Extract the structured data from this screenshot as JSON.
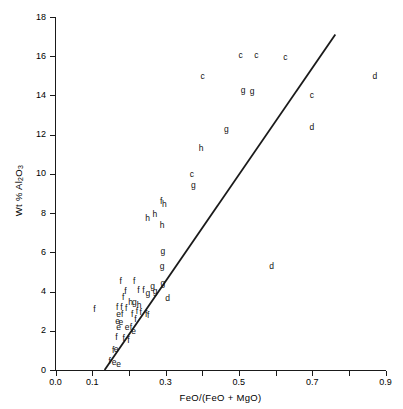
{
  "chart_data": {
    "type": "scatter",
    "title": "",
    "xlabel": "FeO/(FeO + MgO)",
    "ylabel": "Wt % Al2O3",
    "ylabel_html": "Wt % Al<sub>2</sub>O<sub>3</sub>",
    "xlim": [
      0.0,
      0.9
    ],
    "ylim": [
      0,
      18
    ],
    "xticks": [
      0.0,
      0.1,
      0.2,
      0.3,
      0.4,
      0.5,
      0.6,
      0.7,
      0.8,
      0.9
    ],
    "xtick_labels": [
      "0.0",
      "",
      "",
      "0.3",
      "",
      "0.5",
      "",
      "0.7",
      "",
      "0.9"
    ],
    "xtick_labeled": [
      {
        "value": 0.0,
        "label": "0.0"
      },
      {
        "value": 0.1,
        "label": "0.1"
      },
      {
        "value": 0.3,
        "label": "0.3"
      },
      {
        "value": 0.5,
        "label": "0.5"
      },
      {
        "value": 0.7,
        "label": "0.7"
      },
      {
        "value": 0.9,
        "label": "0.9"
      }
    ],
    "yticks": [
      0,
      2,
      4,
      6,
      8,
      10,
      12,
      14,
      16,
      18
    ],
    "ytick_labels": [
      "0",
      "2",
      "4",
      "6",
      "8",
      "10",
      "12",
      "14",
      "16",
      "18"
    ],
    "grid": false,
    "legend": "none",
    "marker_style": "text-letter",
    "series": [
      {
        "name": "c",
        "label_char": "c",
        "color": "#111111"
      },
      {
        "name": "d",
        "label_char": "d",
        "color": "#111111"
      },
      {
        "name": "e",
        "label_char": "e",
        "color": "#111111"
      },
      {
        "name": "f",
        "label_char": "f",
        "color": "#111111"
      },
      {
        "name": "g",
        "label_char": "g",
        "color": "#111111"
      },
      {
        "name": "h",
        "label_char": "h",
        "color": "#111111"
      }
    ],
    "points": [
      {
        "label": "c",
        "x": 0.505,
        "y": 16.05
      },
      {
        "label": "c",
        "x": 0.548,
        "y": 16.05
      },
      {
        "label": "c",
        "x": 0.627,
        "y": 15.95
      },
      {
        "label": "c",
        "x": 0.401,
        "y": 15.0
      },
      {
        "label": "c",
        "x": 0.699,
        "y": 14.05
      },
      {
        "label": "c",
        "x": 0.372,
        "y": 10.0
      },
      {
        "label": "d",
        "x": 0.871,
        "y": 15.0
      },
      {
        "label": "d",
        "x": 0.699,
        "y": 12.4
      },
      {
        "label": "d",
        "x": 0.589,
        "y": 5.3
      },
      {
        "label": "d",
        "x": 0.306,
        "y": 3.65
      },
      {
        "label": "g",
        "x": 0.512,
        "y": 14.3
      },
      {
        "label": "g",
        "x": 0.536,
        "y": 14.25
      },
      {
        "label": "g",
        "x": 0.466,
        "y": 12.3
      },
      {
        "label": "g",
        "x": 0.376,
        "y": 9.45
      },
      {
        "label": "g",
        "x": 0.293,
        "y": 6.05
      },
      {
        "label": "g",
        "x": 0.291,
        "y": 5.3
      },
      {
        "label": "g",
        "x": 0.293,
        "y": 4.45
      },
      {
        "label": "g",
        "x": 0.265,
        "y": 4.3
      },
      {
        "label": "g",
        "x": 0.272,
        "y": 4.05
      },
      {
        "label": "g",
        "x": 0.252,
        "y": 3.95
      },
      {
        "label": "g",
        "x": 0.215,
        "y": 3.45
      },
      {
        "label": "h",
        "x": 0.397,
        "y": 11.3
      },
      {
        "label": "h",
        "x": 0.297,
        "y": 8.45
      },
      {
        "label": "h",
        "x": 0.271,
        "y": 7.95
      },
      {
        "label": "h",
        "x": 0.251,
        "y": 7.75
      },
      {
        "label": "h",
        "x": 0.291,
        "y": 7.4
      },
      {
        "label": "h",
        "x": 0.205,
        "y": 3.45
      },
      {
        "label": "h",
        "x": 0.228,
        "y": 3.3
      },
      {
        "label": "f",
        "x": 0.288,
        "y": 8.6
      },
      {
        "label": "f",
        "x": 0.178,
        "y": 4.55
      },
      {
        "label": "f",
        "x": 0.215,
        "y": 4.55
      },
      {
        "label": "f",
        "x": 0.191,
        "y": 4.05
      },
      {
        "label": "f",
        "x": 0.226,
        "y": 4.1
      },
      {
        "label": "f",
        "x": 0.24,
        "y": 4.1
      },
      {
        "label": "f",
        "x": 0.185,
        "y": 3.75
      },
      {
        "label": "f",
        "x": 0.106,
        "y": 3.1
      },
      {
        "label": "f",
        "x": 0.168,
        "y": 3.2
      },
      {
        "label": "f",
        "x": 0.18,
        "y": 3.2
      },
      {
        "label": "f",
        "x": 0.193,
        "y": 3.15
      },
      {
        "label": "f",
        "x": 0.222,
        "y": 3.0
      },
      {
        "label": "f",
        "x": 0.232,
        "y": 2.95
      },
      {
        "label": "f",
        "x": 0.247,
        "y": 2.85
      },
      {
        "label": "f",
        "x": 0.253,
        "y": 2.8
      },
      {
        "label": "f",
        "x": 0.182,
        "y": 2.85
      },
      {
        "label": "f",
        "x": 0.209,
        "y": 2.85
      },
      {
        "label": "f",
        "x": 0.218,
        "y": 2.6
      },
      {
        "label": "f",
        "x": 0.206,
        "y": 2.2
      },
      {
        "label": "f",
        "x": 0.166,
        "y": 1.7
      },
      {
        "label": "f",
        "x": 0.186,
        "y": 1.65
      },
      {
        "label": "f",
        "x": 0.199,
        "y": 1.55
      },
      {
        "label": "f",
        "x": 0.157,
        "y": 1.0
      },
      {
        "label": "f",
        "x": 0.148,
        "y": 0.45
      },
      {
        "label": "e",
        "x": 0.172,
        "y": 2.85
      },
      {
        "label": "e",
        "x": 0.169,
        "y": 2.5
      },
      {
        "label": "e",
        "x": 0.178,
        "y": 2.45
      },
      {
        "label": "e",
        "x": 0.172,
        "y": 2.2
      },
      {
        "label": "e",
        "x": 0.195,
        "y": 2.2
      },
      {
        "label": "e",
        "x": 0.213,
        "y": 2.0
      },
      {
        "label": "e",
        "x": 0.165,
        "y": 1.05
      },
      {
        "label": "e",
        "x": 0.16,
        "y": 0.4
      },
      {
        "label": "e",
        "x": 0.172,
        "y": 0.3
      }
    ],
    "trend_line": {
      "type": "line",
      "x1": 0.134,
      "y1": 0.0,
      "x2": 0.763,
      "y2": 17.1,
      "color": "#1a1a1a",
      "width": 1.8
    }
  }
}
